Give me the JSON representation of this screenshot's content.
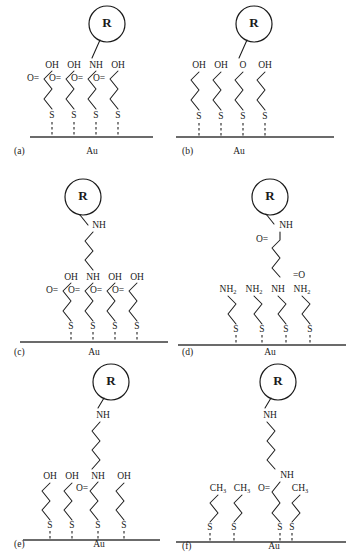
{
  "figure": {
    "core_group_label": "R",
    "substrate_label": "Au",
    "colors": {
      "ink": "#1a1a1a",
      "substrate_line": "#3a3a3a",
      "background": "#ffffff"
    }
  },
  "panels": [
    {
      "id": "a",
      "label": "(a)",
      "substrate": "Au",
      "core_label": "R",
      "terminal_groups": [
        "OH",
        "OH",
        "NH",
        "OH"
      ],
      "carbonyls": [
        "O=",
        "O=",
        "O=",
        "O="
      ],
      "anchor_atoms": [
        "S",
        "S",
        "S",
        "S"
      ],
      "attachment_chain_index": 3,
      "linker_type": "direct",
      "chain_count": 4
    },
    {
      "id": "b",
      "label": "(b)",
      "substrate": "Au",
      "core_label": "R",
      "terminal_groups": [
        "OH",
        "OH",
        "O",
        "OH"
      ],
      "carbonyls": [],
      "anchor_atoms": [
        "S",
        "S",
        "S",
        "S"
      ],
      "attachment_chain_index": 3,
      "linker_type": "direct",
      "chain_count": 4
    },
    {
      "id": "c",
      "label": "(c)",
      "substrate": "Au",
      "core_label": "R",
      "terminal_groups": [
        "OH",
        "NH",
        "OH",
        "OH"
      ],
      "carbonyls": [
        "O=",
        "O=",
        "O=",
        "O="
      ],
      "anchor_atoms": [
        "S",
        "S",
        "S",
        "S"
      ],
      "attachment_chain_index": 2,
      "linker_type": "alkyl-amine",
      "linker_label": "NH",
      "chain_count": 4
    },
    {
      "id": "d",
      "label": "(d)",
      "substrate": "Au",
      "core_label": "R",
      "terminal_groups": [
        "NH2",
        "NH2",
        "NH",
        "NH2"
      ],
      "carbonyls": [],
      "anchor_atoms": [
        "S",
        "S",
        "S",
        "S"
      ],
      "attachment_chain_index": 3,
      "linker_type": "succinyl-diamide",
      "linker_label": "NH",
      "linker_carbonyl_top": "O=",
      "linker_carbonyl_bottom": "=O",
      "chain_count": 4
    },
    {
      "id": "e",
      "label": "(e)",
      "substrate": "Au",
      "core_label": "R",
      "terminal_groups": [
        "OH",
        "OH",
        "NH",
        "OH"
      ],
      "carbonyls": [
        "O="
      ],
      "anchor_atoms": [
        "S",
        "S",
        "S",
        "S"
      ],
      "attachment_chain_index": 3,
      "linker_type": "long-alkyl-amine",
      "linker_label": "NH",
      "chain_count": 4
    },
    {
      "id": "f",
      "label": "(f)",
      "substrate": "Au",
      "core_label": "R",
      "terminal_groups": [
        "CH3",
        "CH3",
        "NH",
        "CH3"
      ],
      "carbonyls": [
        "O="
      ],
      "anchor_atoms": [
        "S",
        "S",
        "S",
        "S"
      ],
      "attachment_chain_index": 3,
      "linker_type": "long-alkyl-amide",
      "linker_label": "NH",
      "chain_count": 4
    }
  ]
}
